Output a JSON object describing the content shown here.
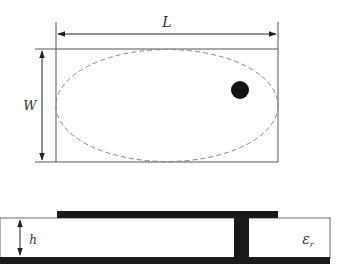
{
  "top_view": {
    "length_label": "L",
    "width_label": "W",
    "outline_color": "#555555",
    "ellipse_color": "#888888",
    "feed_color": "#111111"
  },
  "side_view": {
    "height_label": "h",
    "permittivity_label": "ε",
    "permittivity_subscript": "r",
    "conductor_color": "#1a1a1a"
  }
}
